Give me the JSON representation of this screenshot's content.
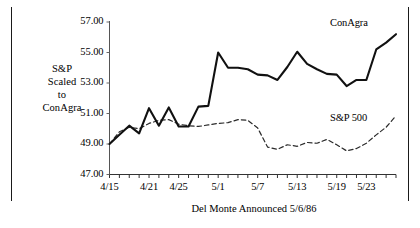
{
  "chart_data": {
    "type": "line",
    "title": "",
    "subtitle": "",
    "xlabel": "Del Monte   Announced 5/6/86",
    "ylabel": "S&P Scaled to ConAgra",
    "ylabel_lines": [
      "S&P",
      "Scaled",
      "to",
      "ConAgra"
    ],
    "ylim": [
      47.0,
      57.0
    ],
    "ytick_labels": [
      "57.00",
      "55.00",
      "53.00",
      "51.00",
      "49.00",
      "47.00"
    ],
    "ytick_values": [
      57.0,
      55.0,
      53.0,
      51.0,
      49.0,
      47.0
    ],
    "xtick_labels": [
      "4/15",
      "4/21",
      "4/25",
      "5/1",
      "5/7",
      "5/13",
      "5/19",
      "5/23"
    ],
    "xtick_indices": [
      0,
      4,
      7,
      11,
      15,
      19,
      23,
      26
    ],
    "x_minor_tick_count": 30,
    "grid": false,
    "legend_position": "inline-right",
    "annotations": [
      {
        "text": "ConAgra",
        "series": "ConAgra"
      },
      {
        "text": "S&P 500",
        "series": "S&P 500"
      }
    ],
    "x": [
      "4/15",
      "4/16",
      "4/17",
      "4/18",
      "4/21",
      "4/22",
      "4/23",
      "4/25",
      "4/28",
      "4/29",
      "4/30",
      "5/1",
      "5/2",
      "5/5",
      "5/6",
      "5/7",
      "5/8",
      "5/9",
      "5/12",
      "5/13",
      "5/14",
      "5/15",
      "5/16",
      "5/19",
      "5/20",
      "5/21",
      "5/23",
      "5/27",
      "5/28",
      "5/29"
    ],
    "series": [
      {
        "name": "ConAgra",
        "style": "solid",
        "color": "#111111",
        "width": 2.1,
        "values": [
          49.0,
          49.6,
          50.2,
          49.7,
          51.35,
          50.2,
          51.4,
          50.15,
          50.15,
          51.45,
          51.5,
          55.0,
          54.0,
          54.0,
          53.9,
          53.55,
          53.5,
          53.2,
          54.05,
          55.05,
          54.25,
          53.9,
          53.6,
          53.55,
          52.8,
          53.2,
          53.2,
          55.2,
          55.65,
          56.2
        ]
      },
      {
        "name": "S&P 500",
        "style": "dashed",
        "color": "#2a2a2a",
        "width": 1.2,
        "values": [
          49.0,
          49.8,
          50.1,
          50.0,
          50.35,
          50.55,
          50.6,
          50.3,
          50.2,
          50.15,
          50.25,
          50.35,
          50.4,
          50.6,
          50.55,
          50.05,
          48.8,
          48.65,
          48.95,
          48.85,
          49.1,
          49.05,
          49.3,
          48.95,
          48.55,
          48.7,
          49.05,
          49.6,
          50.1,
          50.85
        ]
      }
    ]
  },
  "axis": {
    "y_title_lines": [
      "S&P",
      "Scaled",
      "to",
      "ConAgra"
    ]
  },
  "caption": {
    "text": "Del Monte   Announced 5/6/86"
  },
  "labels": {
    "conagra": "ConAgra",
    "sp500": "S&P 500"
  }
}
